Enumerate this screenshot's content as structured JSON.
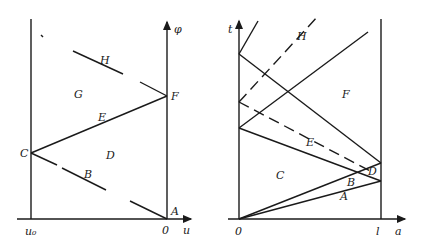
{
  "left_diagram": {
    "axis_labels": {
      "vertical": "φ",
      "horizontal": "u",
      "left_boundary": "u₀",
      "origin": "0"
    },
    "region_labels": {
      "A": "A",
      "B": "B",
      "C": "C",
      "D": "D",
      "E": "E",
      "F": "F",
      "G": "G",
      "H": "H"
    }
  },
  "right_diagram": {
    "axis_labels": {
      "vertical": "t",
      "horizontal": "a",
      "right_boundary": "l",
      "origin": "0"
    },
    "region_labels": {
      "A": "A",
      "B": "B",
      "C": "C",
      "D": "D",
      "E": "E",
      "F": "F",
      "H": "H"
    }
  }
}
